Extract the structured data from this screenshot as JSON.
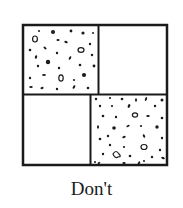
{
  "figure": {
    "caption": "Don't",
    "colors": {
      "stroke": "#1a1a1a",
      "fill": "#ffffff",
      "speckle": "#1a1a1a"
    },
    "cells": [
      {
        "position": "top-left",
        "pattern": "speckled"
      },
      {
        "position": "top-right",
        "pattern": "blank"
      },
      {
        "position": "bottom-left",
        "pattern": "blank"
      },
      {
        "position": "bottom-right",
        "pattern": "speckled"
      }
    ]
  }
}
